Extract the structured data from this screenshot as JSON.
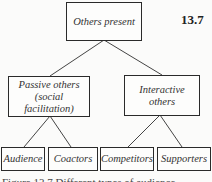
{
  "figure_number": "13.7",
  "nodes": {
    "root": "Others present",
    "passive_line1": "Passive others",
    "passive_line2": "(social facilitation)",
    "interactive": "Interactive others",
    "audience": "Audience",
    "coactors": "Coactors",
    "competitors": "Competitors",
    "supporters": "Supporters"
  },
  "caption": "Figure 13.7 Different types of audience"
}
